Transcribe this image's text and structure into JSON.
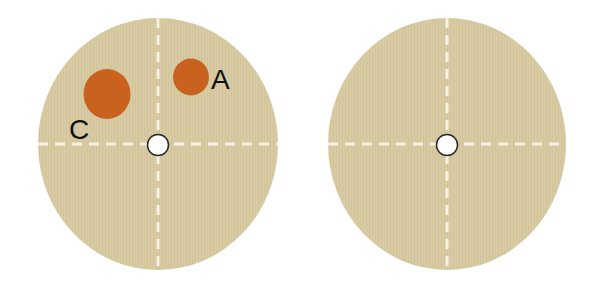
{
  "figure": {
    "colors": {
      "background": "#ffffff",
      "disc_fill": "#d8cba3",
      "disc_stripe": "#cfc198",
      "axis_dash": "#f6f1e4",
      "spot_fill": "#c9611f",
      "hole_fill": "#ffffff",
      "hole_stroke": "#2a2a2a",
      "label_color": "#111111"
    },
    "discs": [
      {
        "id": "left-disc",
        "cx": 158,
        "cy": 144,
        "rx": 120,
        "ry": 126,
        "hole": {
          "cx": 158,
          "cy": 145,
          "r": 10.5
        },
        "spots": [
          {
            "label": "C",
            "cx": 107,
            "cy": 94,
            "rx": 23.5,
            "ry": 25,
            "label_x": 70,
            "label_y": 139
          },
          {
            "label": "A",
            "cx": 191,
            "cy": 77,
            "rx": 18,
            "ry": 18.5,
            "label_x": 212,
            "label_y": 89
          }
        ]
      },
      {
        "id": "right-disc",
        "cx": 447,
        "cy": 144,
        "rx": 119,
        "ry": 126,
        "hole": {
          "cx": 447,
          "cy": 145,
          "r": 10.5
        },
        "spots": []
      }
    ],
    "labels": {
      "spot_a": "A",
      "spot_c": "C"
    }
  }
}
